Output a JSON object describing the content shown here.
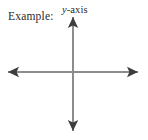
{
  "figure": {
    "width": 148,
    "height": 140,
    "background_color": "#ffffff",
    "caption": "Example:",
    "axis_label_y": {
      "variable": "y",
      "suffix": "-axis",
      "full_text": "y-axis"
    },
    "axes": {
      "line_color": "#8c8c8c",
      "arrow_color": "#3d3d3d",
      "line_width": 2,
      "origin": {
        "x": 73,
        "y": 72
      },
      "horizontal": {
        "x_start": 8,
        "x_end": 138,
        "y": 72
      },
      "vertical": {
        "y_start": 17,
        "y_end": 131,
        "x": 73
      },
      "arrowheads": [
        "left",
        "right",
        "up",
        "down"
      ]
    }
  }
}
